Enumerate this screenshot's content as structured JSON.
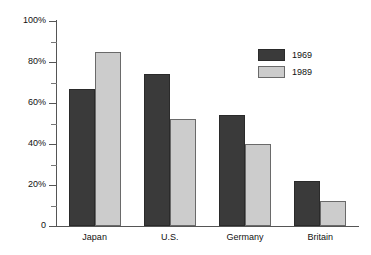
{
  "chart_data": {
    "type": "bar",
    "title": "",
    "subtitle": "",
    "xlabel": "",
    "ylabel": "",
    "categories": [
      "Japan",
      "U.S.",
      "Germany",
      "Britain"
    ],
    "series": [
      {
        "name": "1969",
        "color": "#3a3a3a",
        "values": [
          67,
          74,
          54,
          22
        ]
      },
      {
        "name": "1989",
        "color": "#cccccc",
        "values": [
          85,
          52,
          40,
          12
        ]
      }
    ],
    "ylim": [
      0,
      100
    ],
    "y_ticks": [
      {
        "value": 100,
        "label": "100%"
      },
      {
        "value": 90,
        "label": ""
      },
      {
        "value": 80,
        "label": "80%"
      },
      {
        "value": 70,
        "label": ""
      },
      {
        "value": 60,
        "label": "60%"
      },
      {
        "value": 50,
        "label": ""
      },
      {
        "value": 40,
        "label": "40%"
      },
      {
        "value": 30,
        "label": ""
      },
      {
        "value": 20,
        "label": "20%"
      },
      {
        "value": 10,
        "label": ""
      },
      {
        "value": 0,
        "label": "0"
      }
    ],
    "grid": false,
    "legend_position": "top-right",
    "annotations": []
  }
}
